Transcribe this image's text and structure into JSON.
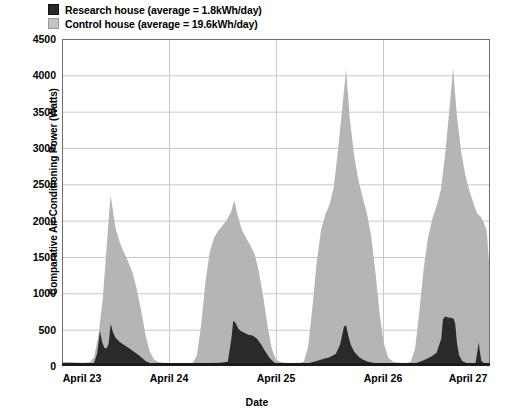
{
  "chart_data": {
    "type": "area",
    "title": "",
    "xlabel": "Date",
    "ylabel": "Comparative Air-Conditioning Power (Watts)",
    "ylim": [
      0,
      4500
    ],
    "yticks": [
      0,
      500,
      1000,
      1500,
      2000,
      2500,
      3000,
      3500,
      4000,
      4500
    ],
    "ytick_labels": [
      "0",
      "500",
      "1000",
      "1500",
      "2000",
      "2500",
      "3000",
      "3500",
      "4000",
      "4500"
    ],
    "xlim": [
      0,
      4
    ],
    "xticks": [
      0,
      1,
      2,
      3,
      4
    ],
    "xtick_labels": [
      "April 23",
      "April 24",
      "April 25",
      "April 26",
      "April 27"
    ],
    "grid": true,
    "legend_position": "above-plot-left",
    "legend": [
      {
        "name": "Research house (average = 1.8kWh/day)",
        "color": "#2a2a2a"
      },
      {
        "name": "Control house (average = 19.6kWh/day)",
        "color": "#c4c4c4"
      }
    ],
    "series": [
      {
        "name": "Control house",
        "color": "#b5b5b5",
        "points": [
          [
            0.0,
            60
          ],
          [
            0.05,
            55
          ],
          [
            0.1,
            50
          ],
          [
            0.15,
            48
          ],
          [
            0.2,
            45
          ],
          [
            0.26,
            50
          ],
          [
            0.3,
            120
          ],
          [
            0.34,
            420
          ],
          [
            0.38,
            900
          ],
          [
            0.41,
            1500
          ],
          [
            0.44,
            2100
          ],
          [
            0.455,
            2350
          ],
          [
            0.47,
            2200
          ],
          [
            0.5,
            1900
          ],
          [
            0.54,
            1700
          ],
          [
            0.58,
            1560
          ],
          [
            0.62,
            1430
          ],
          [
            0.66,
            1280
          ],
          [
            0.7,
            1050
          ],
          [
            0.74,
            760
          ],
          [
            0.78,
            430
          ],
          [
            0.82,
            200
          ],
          [
            0.86,
            90
          ],
          [
            0.9,
            55
          ],
          [
            0.95,
            45
          ],
          [
            1.0,
            40
          ],
          [
            1.08,
            38
          ],
          [
            1.16,
            36
          ],
          [
            1.22,
            40
          ],
          [
            1.26,
            140
          ],
          [
            1.3,
            560
          ],
          [
            1.34,
            1150
          ],
          [
            1.38,
            1560
          ],
          [
            1.42,
            1760
          ],
          [
            1.46,
            1860
          ],
          [
            1.5,
            1930
          ],
          [
            1.54,
            2010
          ],
          [
            1.58,
            2120
          ],
          [
            1.61,
            2280
          ],
          [
            1.64,
            2080
          ],
          [
            1.68,
            1880
          ],
          [
            1.72,
            1760
          ],
          [
            1.76,
            1660
          ],
          [
            1.8,
            1540
          ],
          [
            1.84,
            1300
          ],
          [
            1.88,
            960
          ],
          [
            1.92,
            560
          ],
          [
            1.96,
            240
          ],
          [
            2.0,
            90
          ],
          [
            2.05,
            50
          ],
          [
            2.1,
            42
          ],
          [
            2.16,
            40
          ],
          [
            2.22,
            40
          ],
          [
            2.26,
            60
          ],
          [
            2.3,
            260
          ],
          [
            2.34,
            800
          ],
          [
            2.38,
            1420
          ],
          [
            2.42,
            1860
          ],
          [
            2.46,
            2080
          ],
          [
            2.5,
            2220
          ],
          [
            2.54,
            2460
          ],
          [
            2.58,
            2980
          ],
          [
            2.62,
            3560
          ],
          [
            2.655,
            4080
          ],
          [
            2.69,
            3400
          ],
          [
            2.73,
            2900
          ],
          [
            2.77,
            2560
          ],
          [
            2.81,
            2320
          ],
          [
            2.85,
            2100
          ],
          [
            2.89,
            1780
          ],
          [
            2.93,
            1280
          ],
          [
            2.97,
            700
          ],
          [
            3.01,
            300
          ],
          [
            3.05,
            110
          ],
          [
            3.1,
            55
          ],
          [
            3.16,
            45
          ],
          [
            3.22,
            42
          ],
          [
            3.26,
            60
          ],
          [
            3.3,
            240
          ],
          [
            3.34,
            760
          ],
          [
            3.38,
            1340
          ],
          [
            3.42,
            1760
          ],
          [
            3.46,
            2020
          ],
          [
            3.5,
            2200
          ],
          [
            3.54,
            2420
          ],
          [
            3.58,
            2900
          ],
          [
            3.62,
            3520
          ],
          [
            3.655,
            4100
          ],
          [
            3.69,
            3450
          ],
          [
            3.73,
            2950
          ],
          [
            3.77,
            2620
          ],
          [
            3.81,
            2400
          ],
          [
            3.85,
            2220
          ],
          [
            3.88,
            2100
          ],
          [
            3.91,
            2060
          ],
          [
            3.94,
            1980
          ],
          [
            3.97,
            1860
          ],
          [
            4.0,
            1230
          ]
        ]
      },
      {
        "name": "Research house",
        "color": "#2a2a2a",
        "points": [
          [
            0.0,
            25
          ],
          [
            0.1,
            22
          ],
          [
            0.2,
            20
          ],
          [
            0.26,
            22
          ],
          [
            0.3,
            45
          ],
          [
            0.33,
            180
          ],
          [
            0.355,
            480
          ],
          [
            0.375,
            330
          ],
          [
            0.395,
            250
          ],
          [
            0.415,
            240
          ],
          [
            0.435,
            300
          ],
          [
            0.455,
            580
          ],
          [
            0.475,
            470
          ],
          [
            0.5,
            390
          ],
          [
            0.54,
            330
          ],
          [
            0.58,
            290
          ],
          [
            0.62,
            250
          ],
          [
            0.66,
            210
          ],
          [
            0.7,
            170
          ],
          [
            0.74,
            120
          ],
          [
            0.78,
            70
          ],
          [
            0.82,
            40
          ],
          [
            0.88,
            28
          ],
          [
            0.95,
            24
          ],
          [
            1.0,
            22
          ],
          [
            1.16,
            20
          ],
          [
            1.24,
            22
          ],
          [
            1.3,
            30
          ],
          [
            1.4,
            40
          ],
          [
            1.48,
            45
          ],
          [
            1.55,
            60
          ],
          [
            1.585,
            400
          ],
          [
            1.6,
            620
          ],
          [
            1.62,
            600
          ],
          [
            1.645,
            520
          ],
          [
            1.67,
            480
          ],
          [
            1.7,
            460
          ],
          [
            1.74,
            430
          ],
          [
            1.78,
            420
          ],
          [
            1.82,
            380
          ],
          [
            1.86,
            300
          ],
          [
            1.9,
            200
          ],
          [
            1.94,
            110
          ],
          [
            1.98,
            50
          ],
          [
            2.02,
            28
          ],
          [
            2.1,
            22
          ],
          [
            2.2,
            20
          ],
          [
            2.26,
            24
          ],
          [
            2.32,
            45
          ],
          [
            2.38,
            70
          ],
          [
            2.44,
            95
          ],
          [
            2.5,
            120
          ],
          [
            2.56,
            170
          ],
          [
            2.6,
            300
          ],
          [
            2.635,
            540
          ],
          [
            2.655,
            560
          ],
          [
            2.675,
            420
          ],
          [
            2.7,
            290
          ],
          [
            2.73,
            200
          ],
          [
            2.77,
            130
          ],
          [
            2.81,
            90
          ],
          [
            2.86,
            60
          ],
          [
            2.92,
            40
          ],
          [
            3.0,
            28
          ],
          [
            3.1,
            22
          ],
          [
            3.2,
            20
          ],
          [
            3.26,
            24
          ],
          [
            3.32,
            45
          ],
          [
            3.38,
            80
          ],
          [
            3.44,
            120
          ],
          [
            3.5,
            180
          ],
          [
            3.545,
            380
          ],
          [
            3.56,
            640
          ],
          [
            3.58,
            680
          ],
          [
            3.6,
            670
          ],
          [
            3.625,
            665
          ],
          [
            3.645,
            660
          ],
          [
            3.66,
            650
          ],
          [
            3.675,
            580
          ],
          [
            3.69,
            330
          ],
          [
            3.71,
            150
          ],
          [
            3.74,
            70
          ],
          [
            3.78,
            40
          ],
          [
            3.83,
            30
          ],
          [
            3.865,
            40
          ],
          [
            3.885,
            230
          ],
          [
            3.895,
            330
          ],
          [
            3.905,
            200
          ],
          [
            3.92,
            70
          ],
          [
            3.95,
            35
          ],
          [
            3.98,
            28
          ],
          [
            4.0,
            25
          ]
        ]
      }
    ]
  },
  "axes": {
    "ytick_labels": [
      "4500",
      "4000",
      "3500",
      "3000",
      "2500",
      "2000",
      "1500",
      "1000",
      "500",
      "0"
    ],
    "xtick_labels": [
      "April 23",
      "April 24",
      "April 25",
      "April 26",
      "April 27"
    ],
    "ylabel": "Comparative Air-Conditioning Power (Watts)",
    "xlabel": "Date"
  },
  "legend": {
    "research_label": "Research house (average = 1.8kWh/day)",
    "control_label": "Control house (average = 19.6kWh/day)"
  },
  "colors": {
    "research_fill": "#2a2a2a",
    "control_fill": "#b5b5b5",
    "grid": "#c8c8c8",
    "axis": "#6f6f6f",
    "text": "#000000",
    "background": "#ffffff"
  }
}
